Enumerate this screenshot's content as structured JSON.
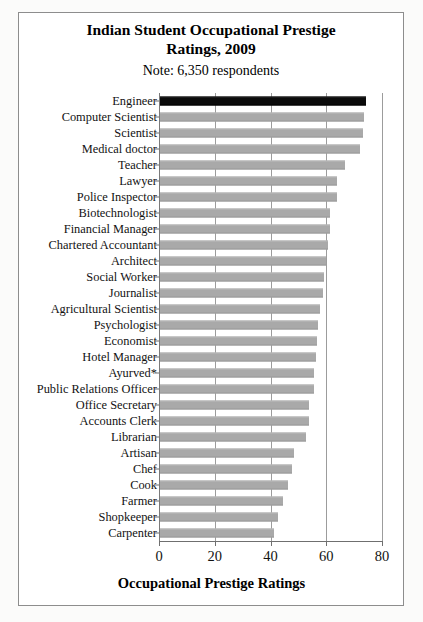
{
  "figure": {
    "title_lines": [
      "Indian Student Occupational Prestige",
      "Ratings, 2009"
    ],
    "subtitle": "Note: 6,350 respondents",
    "bar_color": "#a9a9a9",
    "highlight_color": "#0b0b0b",
    "frame_color": "#8d8d8d"
  },
  "chart_data": {
    "type": "bar",
    "orientation": "horizontal",
    "title": "Indian Student Occupational Prestige Ratings, 2009",
    "subtitle": "Note: 6,350 respondents",
    "xlabel": "Occupational Prestige Ratings",
    "ylabel": "",
    "xlim": [
      0,
      80
    ],
    "xticks": [
      0,
      20,
      40,
      60,
      80
    ],
    "xtick_labels": [
      "0",
      "20",
      "40",
      "60",
      "80"
    ],
    "grid": true,
    "grid_axis": "x",
    "legend": null,
    "highlight_category": "Engineer",
    "categories": [
      "Engineer",
      "Computer Scientist",
      "Scientist",
      "Medical doctor",
      "Teacher",
      "Lawyer",
      "Police Inspector",
      "Biotechnologist",
      "Financial Manager",
      "Chartered Accountant",
      "Architect",
      "Social Worker",
      "Journalist",
      "Agricultural Scientist",
      "Psychologist",
      "Economist",
      "Hotel Manager",
      "Ayurved*",
      "Public Relations Officer",
      "Office Secretary",
      "Accounts Clerk",
      "Librarian",
      "Artisan",
      "Chef",
      "Cook",
      "Farmer",
      "Shopkeeper",
      "Carpenter"
    ],
    "values": [
      74.0,
      73.3,
      72.9,
      71.6,
      66.5,
      63.5,
      63.4,
      61.1,
      61.0,
      60.4,
      59.6,
      59.0,
      58.6,
      57.5,
      56.8,
      56.4,
      56.0,
      55.4,
      55.2,
      53.6,
      53.4,
      52.2,
      47.9,
      47.3,
      45.9,
      44.0,
      42.5,
      41.0
    ]
  }
}
